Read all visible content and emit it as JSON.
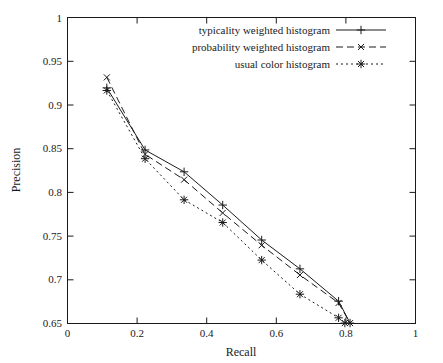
{
  "chart_data": {
    "type": "line",
    "title": "",
    "xlabel": "Recall",
    "ylabel": "Precision",
    "xlim": [
      0,
      1
    ],
    "ylim": [
      0.65,
      1
    ],
    "xticks": [
      "0",
      "0.2",
      "0.4",
      "0.6",
      "0.8",
      "1"
    ],
    "xtickvals": [
      0,
      0.2,
      0.4,
      0.6,
      0.8,
      1
    ],
    "yticks": [
      "0.65",
      "0.7",
      "0.75",
      "0.8",
      "0.85",
      "0.9",
      "0.95",
      "1"
    ],
    "ytickvals": [
      0.65,
      0.7,
      0.75,
      0.8,
      0.85,
      0.9,
      0.95,
      1
    ],
    "grid": false,
    "legend_position": "top-right",
    "series": [
      {
        "name": "typicality weighted histogram",
        "marker": "plus",
        "dash": "solid",
        "x": [
          0.113,
          0.223,
          0.335,
          0.446,
          0.558,
          0.668,
          0.779,
          0.812
        ],
        "y": [
          0.9195,
          0.8485,
          0.8235,
          0.7855,
          0.7455,
          0.7125,
          0.6755,
          0.6505
        ]
      },
      {
        "name": "probability weighted histogram",
        "marker": "cross",
        "dash": "dashed",
        "x": [
          0.113,
          0.223,
          0.335,
          0.446,
          0.558,
          0.668,
          0.779,
          0.812
        ],
        "y": [
          0.9315,
          0.8435,
          0.8145,
          0.7765,
          0.7395,
          0.7055,
          0.6735,
          0.6505
        ]
      },
      {
        "name": "usual color histogram",
        "marker": "asterisk",
        "dash": "dotted",
        "x": [
          0.113,
          0.223,
          0.335,
          0.446,
          0.558,
          0.668,
          0.779,
          0.797
        ],
        "y": [
          0.9165,
          0.8385,
          0.7915,
          0.7655,
          0.7225,
          0.6835,
          0.6565,
          0.6505
        ]
      }
    ]
  }
}
